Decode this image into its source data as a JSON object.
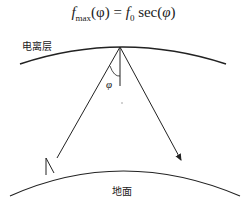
{
  "formula": {
    "lhs_symbol": "f",
    "lhs_subscript": "max",
    "lhs_arg": "(φ)",
    "equals": " = ",
    "rhs_symbol": "f",
    "rhs_subscript": "0",
    "rhs_func": " sec(",
    "rhs_arg": "φ",
    "rhs_close": ")"
  },
  "labels": {
    "ionosphere": "电离层",
    "ground": "地面",
    "angle": "φ"
  }
}
